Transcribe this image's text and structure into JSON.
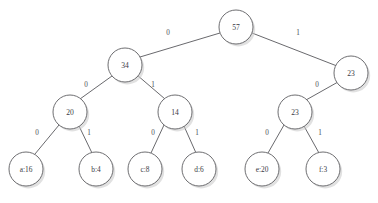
{
  "figure": {
    "type": "huffman-tree",
    "background_color": "#ffffff",
    "node_fill": "#ffffff",
    "node_stroke": "#5d5d61",
    "edge_stroke": "#58585c",
    "text_color": "#3a3a44",
    "shadow_color": "#c9c9c9"
  },
  "nodes": [
    {
      "id": "root",
      "label": "57",
      "cx": 236,
      "cy": 27,
      "r": 17,
      "kind": "internal"
    },
    {
      "id": "n34",
      "label": "34",
      "cx": 125,
      "cy": 65,
      "r": 17,
      "kind": "internal"
    },
    {
      "id": "n23a",
      "label": "23",
      "cx": 351,
      "cy": 73,
      "r": 17,
      "kind": "internal"
    },
    {
      "id": "n20",
      "label": "20",
      "cx": 70,
      "cy": 112,
      "r": 17,
      "kind": "internal"
    },
    {
      "id": "n14",
      "label": "14",
      "cx": 175,
      "cy": 112,
      "r": 17,
      "kind": "internal"
    },
    {
      "id": "n23b",
      "label": "23",
      "cx": 295,
      "cy": 112,
      "r": 17,
      "kind": "internal"
    },
    {
      "id": "la",
      "label": "a:16",
      "cx": 26,
      "cy": 169,
      "r": 17,
      "kind": "leaf"
    },
    {
      "id": "lb",
      "label": "b:4",
      "cx": 96,
      "cy": 169,
      "r": 17,
      "kind": "leaf"
    },
    {
      "id": "lc",
      "label": "c:8",
      "cx": 145,
      "cy": 169,
      "r": 17,
      "kind": "leaf"
    },
    {
      "id": "ld",
      "label": "d:6",
      "cx": 199,
      "cy": 169,
      "r": 17,
      "kind": "leaf"
    },
    {
      "id": "le",
      "label": "e:20",
      "cx": 262,
      "cy": 169,
      "r": 17,
      "kind": "leaf"
    },
    {
      "id": "lf",
      "label": "f:3",
      "cx": 323,
      "cy": 169,
      "r": 17,
      "kind": "leaf"
    }
  ],
  "edges": [
    {
      "from": "root",
      "to": "n34",
      "label": "0",
      "x1": 220,
      "y1": 33,
      "x2": 140,
      "y2": 57,
      "lx": 168,
      "ly": 33
    },
    {
      "from": "root",
      "to": "n23a",
      "label": "1",
      "x1": 252,
      "y1": 33,
      "x2": 337,
      "y2": 66,
      "lx": 298,
      "ly": 33
    },
    {
      "from": "n34",
      "to": "n20",
      "label": "0",
      "x1": 112,
      "y1": 76,
      "x2": 80,
      "y2": 99,
      "lx": 86,
      "ly": 85
    },
    {
      "from": "n34",
      "to": "n14",
      "label": "1",
      "x1": 137,
      "y1": 75,
      "x2": 165,
      "y2": 99,
      "lx": 153,
      "ly": 85
    },
    {
      "from": "n23a",
      "to": "n23b",
      "label": "0",
      "x1": 338,
      "y1": 82,
      "x2": 306,
      "y2": 100,
      "lx": 317,
      "ly": 85
    },
    {
      "from": "n20",
      "to": "la",
      "label": "0",
      "x1": 59,
      "y1": 125,
      "x2": 35,
      "y2": 154,
      "lx": 37,
      "ly": 133
    },
    {
      "from": "n20",
      "to": "lb",
      "label": "1",
      "x1": 79,
      "y1": 126,
      "x2": 92,
      "y2": 153,
      "lx": 89,
      "ly": 133
    },
    {
      "from": "n14",
      "to": "lc",
      "label": "0",
      "x1": 164,
      "y1": 125,
      "x2": 151,
      "y2": 153,
      "lx": 153,
      "ly": 133
    },
    {
      "from": "n14",
      "to": "ld",
      "label": "1",
      "x1": 184,
      "y1": 126,
      "x2": 196,
      "y2": 153,
      "lx": 197,
      "ly": 133
    },
    {
      "from": "n23b",
      "to": "le",
      "label": "0",
      "x1": 284,
      "y1": 125,
      "x2": 268,
      "y2": 153,
      "lx": 267,
      "ly": 133
    },
    {
      "from": "n23b",
      "to": "lf",
      "label": "1",
      "x1": 304,
      "y1": 126,
      "x2": 319,
      "y2": 153,
      "lx": 320,
      "ly": 133
    }
  ]
}
